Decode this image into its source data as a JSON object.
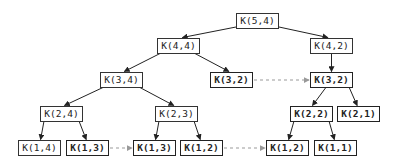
{
  "diagram": {
    "title": "",
    "nodes": [
      {
        "id": "n54",
        "label": "K(5,4)",
        "bold": false,
        "x": 236,
        "y": 13,
        "w": 43
      },
      {
        "id": "n44",
        "label": "K(4,4)",
        "bold": false,
        "x": 157,
        "y": 38,
        "w": 43
      },
      {
        "id": "n42",
        "label": "K(4,2)",
        "bold": false,
        "x": 310,
        "y": 38,
        "w": 43
      },
      {
        "id": "n34",
        "label": "K(3,4)",
        "bold": false,
        "x": 100,
        "y": 72,
        "w": 43
      },
      {
        "id": "n32a",
        "label": "K(3,2)",
        "bold": true,
        "x": 210,
        "y": 72,
        "w": 43
      },
      {
        "id": "n32b",
        "label": "K(3,2)",
        "bold": true,
        "x": 310,
        "y": 72,
        "w": 43
      },
      {
        "id": "n24",
        "label": "K(2,4)",
        "bold": false,
        "x": 40,
        "y": 106,
        "w": 43
      },
      {
        "id": "n23",
        "label": "K(2,3)",
        "bold": false,
        "x": 155,
        "y": 106,
        "w": 43
      },
      {
        "id": "n22",
        "label": "K(2,2)",
        "bold": true,
        "x": 290,
        "y": 106,
        "w": 43
      },
      {
        "id": "n21",
        "label": "K(2,1)",
        "bold": true,
        "x": 337,
        "y": 106,
        "w": 43
      },
      {
        "id": "n14",
        "label": "K(1,4)",
        "bold": false,
        "x": 18,
        "y": 140,
        "w": 43
      },
      {
        "id": "n13a",
        "label": "K(1,3)",
        "bold": true,
        "x": 66,
        "y": 140,
        "w": 43
      },
      {
        "id": "n13b",
        "label": "K(1,3)",
        "bold": true,
        "x": 133,
        "y": 140,
        "w": 43
      },
      {
        "id": "n12a",
        "label": "K(1,2)",
        "bold": true,
        "x": 180,
        "y": 140,
        "w": 43
      },
      {
        "id": "n12b",
        "label": "K(1,2)",
        "bold": true,
        "x": 266,
        "y": 140,
        "w": 43
      },
      {
        "id": "n11",
        "label": "K(1,1)",
        "bold": true,
        "x": 314,
        "y": 140,
        "w": 43
      }
    ],
    "edges": [
      {
        "from": "n54",
        "to": "n44",
        "style": "solid"
      },
      {
        "from": "n54",
        "to": "n42",
        "style": "solid"
      },
      {
        "from": "n44",
        "to": "n34",
        "style": "solid"
      },
      {
        "from": "n44",
        "to": "n32a",
        "style": "solid"
      },
      {
        "from": "n42",
        "to": "n32b",
        "style": "solid"
      },
      {
        "from": "n34",
        "to": "n24",
        "style": "solid"
      },
      {
        "from": "n34",
        "to": "n23",
        "style": "solid"
      },
      {
        "from": "n32b",
        "to": "n22",
        "style": "solid"
      },
      {
        "from": "n32b",
        "to": "n21",
        "style": "solid"
      },
      {
        "from": "n24",
        "to": "n14",
        "style": "solid"
      },
      {
        "from": "n24",
        "to": "n13a",
        "style": "solid"
      },
      {
        "from": "n23",
        "to": "n13b",
        "style": "solid"
      },
      {
        "from": "n23",
        "to": "n12a",
        "style": "solid"
      },
      {
        "from": "n22",
        "to": "n12b",
        "style": "solid"
      },
      {
        "from": "n22",
        "to": "n11",
        "style": "solid"
      }
    ],
    "dashed_links": [
      {
        "from": "n32a",
        "to": "n32b",
        "style": "dashed"
      },
      {
        "from": "n13a",
        "to": "n13b",
        "style": "dashed"
      },
      {
        "from": "n12a",
        "to": "n12b",
        "style": "dashed"
      }
    ],
    "colors": {
      "edge": "#222222",
      "dashed": "#999999",
      "border": "#333333",
      "text": "#222222",
      "background": "#ffffff"
    }
  }
}
